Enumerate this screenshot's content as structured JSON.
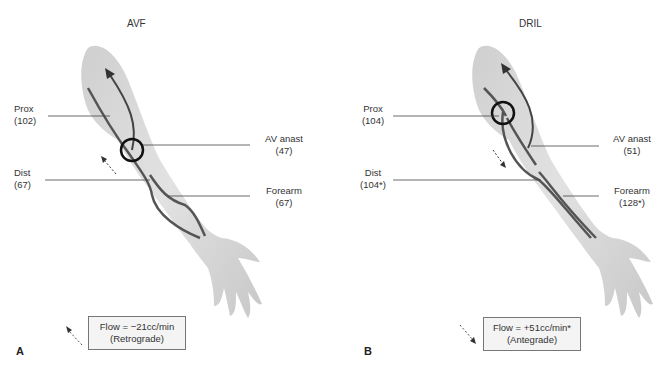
{
  "figure": {
    "panels": [
      {
        "id": "A",
        "letter": "A",
        "title": "AVF",
        "labels": {
          "prox": {
            "name": "Prox",
            "value": "(102)"
          },
          "dist": {
            "name": "Dist",
            "value": "(67)"
          },
          "av_anast": {
            "name": "AV anast",
            "value": "(47)"
          },
          "forearm": {
            "name": "Forearm",
            "value": "(67)"
          }
        },
        "flow": {
          "line1": "Flow = −21cc/min",
          "line2": "(Retrograde)",
          "direction": "retrograde"
        }
      },
      {
        "id": "B",
        "letter": "B",
        "title": "DRIL",
        "labels": {
          "prox": {
            "name": "Prox",
            "value": "(104)"
          },
          "dist": {
            "name": "Dist",
            "value": "(104*)"
          },
          "av_anast": {
            "name": "AV anast",
            "value": "(51)"
          },
          "forearm": {
            "name": "Forearm",
            "value": "(128*)"
          }
        },
        "flow": {
          "line1": "Flow = +51cc/min*",
          "line2": "(Antegrade)",
          "direction": "antegrade"
        }
      }
    ],
    "colors": {
      "skin": "#d9d9d9",
      "vessel": "#555555",
      "circle": "#111111",
      "leader": "#444444"
    }
  }
}
